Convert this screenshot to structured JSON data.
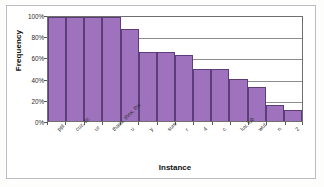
{
  "figure": {
    "x_axis_title": "Instance",
    "y_axis_title": "Frequency"
  },
  "colors": {
    "bar_fill": "#9f72bd",
    "bar_border": "#5d3d78",
    "gridline": "#8d8d8d",
    "axis": "#5a5a5a",
    "frame": "#b9bcc4",
    "text": "#2b2b2b"
  },
  "chart_data": {
    "type": "bar",
    "title": "",
    "xlabel": "Instance",
    "ylabel": "Frequency",
    "ylim": [
      0,
      100
    ],
    "yticks": [
      0,
      20,
      40,
      60,
      80,
      100
    ],
    "ytick_labels": [
      "0%",
      "20%",
      "40%",
      "60%",
      "80%",
      "100%"
    ],
    "grid": true,
    "legend": "none",
    "categories": [
      "ppl",
      "cuz, bc",
      "ur",
      "thanx, thnx, thx",
      "u",
      "y",
      "sum",
      "r",
      "4",
      "c",
      "luv, lub",
      "wut",
      "n",
      "2"
    ],
    "values": [
      100,
      100,
      100,
      100,
      88,
      66,
      66,
      63,
      50,
      50,
      40,
      33,
      15,
      11
    ],
    "value_labels": [
      "100%",
      "100%",
      "100%",
      "100%",
      "88%",
      "66%",
      "66%",
      "63%",
      "50%",
      "50%",
      "40%",
      "33%",
      "15%",
      "11%"
    ]
  }
}
